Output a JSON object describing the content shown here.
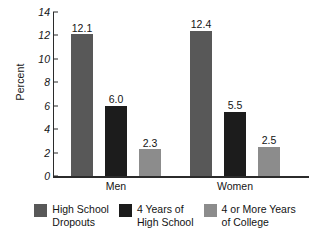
{
  "chart_data": {
    "type": "bar",
    "title": "",
    "xlabel": "",
    "ylabel": "Percent",
    "ylim": [
      0,
      14
    ],
    "yticks": [
      0,
      2,
      4,
      6,
      8,
      10,
      12,
      14
    ],
    "grid": false,
    "legend_position": "bottom",
    "categories": [
      "Men",
      "Women"
    ],
    "series": [
      {
        "name": "High School Dropouts",
        "legend_label_line1": "High School",
        "legend_label_line2": "Dropouts",
        "color": "#585858",
        "values": [
          12.1,
          12.4
        ],
        "value_labels": [
          "12.1",
          "12.4"
        ]
      },
      {
        "name": "4 Years of High School",
        "legend_label_line1": "4 Years of",
        "legend_label_line2": "High School",
        "color": "#1c1c1c",
        "values": [
          6.0,
          5.5
        ],
        "value_labels": [
          "6.0",
          "5.5"
        ]
      },
      {
        "name": "4 or More Years of College",
        "legend_label_line1": "4 or More Years",
        "legend_label_line2": "of College",
        "color": "#8c8c8c",
        "values": [
          2.3,
          2.5
        ],
        "value_labels": [
          "2.3",
          "2.5"
        ]
      }
    ],
    "ytick_labels": [
      "0",
      "2",
      "4",
      "6",
      "8",
      "10",
      "12",
      "14"
    ],
    "axis_color": "#2b2b2b",
    "background": "#ffffff"
  }
}
